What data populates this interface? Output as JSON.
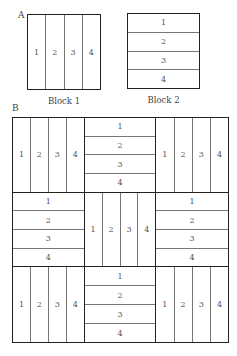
{
  "panel_a": {
    "label": "A",
    "block1": {
      "caption": "Block 1",
      "orientation": "vertical",
      "strips": [
        "1",
        "2",
        "3",
        "4"
      ]
    },
    "block2": {
      "caption": "Block 2",
      "orientation": "horizontal",
      "strips": [
        "1",
        "2",
        "3",
        "4"
      ]
    }
  },
  "panel_b": {
    "label": "B",
    "cells": [
      {
        "orientation": "vertical",
        "strips": [
          "1",
          "2",
          "3",
          "4"
        ]
      },
      {
        "orientation": "horizontal",
        "strips": [
          "1",
          "2",
          "3",
          "4"
        ]
      },
      {
        "orientation": "vertical",
        "strips": [
          "1",
          "2",
          "3",
          "4"
        ]
      },
      {
        "orientation": "horizontal",
        "strips": [
          "1",
          "2",
          "3",
          "4"
        ]
      },
      {
        "orientation": "vertical",
        "strips": [
          "1",
          "2",
          "3",
          "4"
        ]
      },
      {
        "orientation": "horizontal",
        "strips": [
          "1",
          "2",
          "3",
          "4"
        ]
      },
      {
        "orientation": "vertical",
        "strips": [
          "1",
          "2",
          "3",
          "4"
        ]
      },
      {
        "orientation": "horizontal",
        "strips": [
          "1",
          "2",
          "3",
          "4"
        ]
      },
      {
        "orientation": "vertical",
        "strips": [
          "1",
          "2",
          "3",
          "4"
        ]
      }
    ]
  }
}
